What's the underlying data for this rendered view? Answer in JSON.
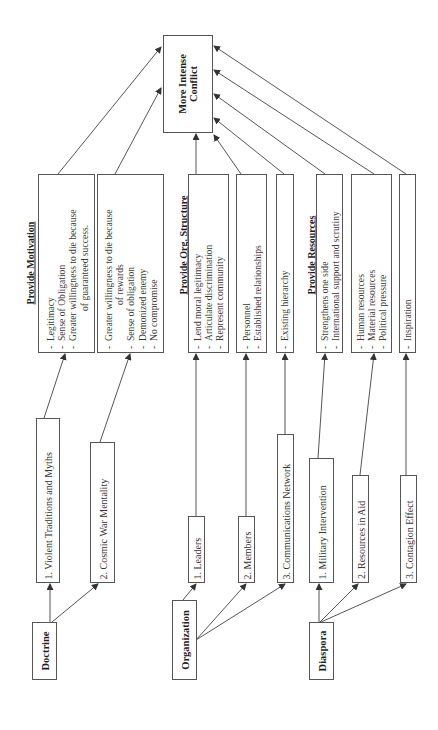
{
  "diagram": {
    "orientation": "rotated-90-ccw",
    "outcome": {
      "label_line1": "More Intense",
      "label_line2": "Conflict"
    },
    "groups": [
      {
        "root": "Doctrine",
        "header": "Provide Motivation",
        "items": [
          {
            "label": "1. Violent Traditions and Myths",
            "effects": [
              "Legitimacy",
              "Sense of Obligation",
              "Greater willingness to die because",
              "of guaranteed success."
            ]
          },
          {
            "label": "2. Cosmic War Mentality",
            "effects": [
              "Greater willingness to die because",
              "of rewards",
              "Sense of obligation",
              "Demonized enemy",
              "No compromise"
            ]
          }
        ]
      },
      {
        "root": "Organization",
        "header": "Provide Org. Structure",
        "items": [
          {
            "label": "1. Leaders",
            "effects": [
              "Lend moral legitimacy",
              "Articulate discrimination",
              "Represent community"
            ]
          },
          {
            "label": "2. Members",
            "effects": [
              "Personnel",
              "Established relationships"
            ]
          },
          {
            "label": "3. Communications Network",
            "effects": [
              "Existing hierarchy"
            ]
          }
        ]
      },
      {
        "root": "Diaspora",
        "header": "Provide Resources",
        "items": [
          {
            "label": "1. Military Intervention",
            "effects": [
              "Strengthens one side",
              "International support and scrutiny"
            ]
          },
          {
            "label": "2. Resources in Aid",
            "effects": [
              "Human resources",
              "Material resources",
              "Political pressure"
            ]
          },
          {
            "label": "3. Contagion Effect",
            "effects": [
              "Inspiration"
            ]
          }
        ]
      }
    ]
  },
  "colors": {
    "line": "#555555",
    "text": "#2a2a2a",
    "background": "#ffffff"
  }
}
